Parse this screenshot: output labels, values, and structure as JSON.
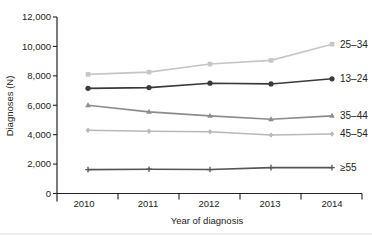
{
  "chart_data": {
    "type": "line",
    "title": "",
    "xlabel": "Year of diagnosis",
    "ylabel": "Diagnoses (N)",
    "ylim": [
      0,
      12000
    ],
    "yticks": [
      0,
      2000,
      4000,
      6000,
      8000,
      10000,
      12000
    ],
    "ytick_labels": [
      "0",
      "2,000",
      "4,000",
      "6,000",
      "8,000",
      "10,000",
      "12,000"
    ],
    "x": [
      "2010",
      "2011",
      "2012",
      "2013",
      "2014"
    ],
    "grid": false,
    "legend_position": "inline-right",
    "series": [
      {
        "name": "25–34",
        "values": [
          8100,
          8250,
          8800,
          9050,
          10150
        ],
        "color": "#c6c6c6",
        "marker": "square"
      },
      {
        "name": "13–24",
        "values": [
          7150,
          7200,
          7500,
          7450,
          7800
        ],
        "color": "#3a3a3a",
        "marker": "circle"
      },
      {
        "name": "35–44",
        "values": [
          6000,
          5550,
          5280,
          5050,
          5280
        ],
        "color": "#8c8c8c",
        "marker": "triangle"
      },
      {
        "name": "45–54",
        "values": [
          4300,
          4230,
          4200,
          3980,
          4050
        ],
        "color": "#b8b8b8",
        "marker": "diamond"
      },
      {
        "name": "≥55",
        "values": [
          1620,
          1650,
          1630,
          1760,
          1760
        ],
        "color": "#555555",
        "marker": "plus"
      }
    ]
  }
}
